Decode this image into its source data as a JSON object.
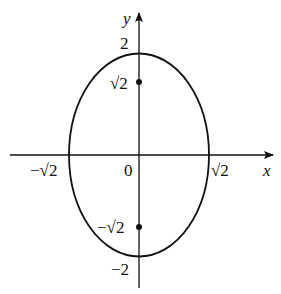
{
  "diagram": {
    "type": "ellipse-with-foci",
    "axes": {
      "x_label": "x",
      "y_label": "y",
      "origin_label": "0"
    },
    "ticks": {
      "x_neg": "−√2",
      "x_pos": "√2",
      "y_top": "2",
      "y_bottom": "−2",
      "focus_top": "√2",
      "focus_bottom": "−√2"
    },
    "ellipse": {
      "semi_x": "√2",
      "semi_y": "2"
    },
    "foci": [
      {
        "x": 0,
        "y": "√2"
      },
      {
        "x": 0,
        "y": "−√2"
      }
    ],
    "colors": {
      "stroke": "#111111",
      "background": "#ffffff"
    }
  }
}
